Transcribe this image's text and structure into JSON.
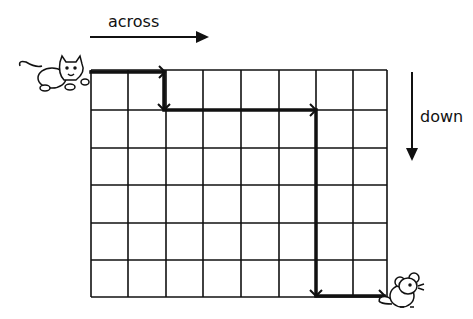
{
  "labels": {
    "across": "across",
    "down": "down"
  },
  "grid": {
    "columns": 8,
    "rows": 6,
    "x_lines": [
      91,
      128,
      166,
      203,
      241,
      279,
      316,
      353,
      387
    ],
    "y_lines": [
      70,
      110,
      148,
      185,
      223,
      260,
      297
    ]
  },
  "path": {
    "description": "Route from cat (top-left) to mouse (bottom-right)",
    "steps": [
      {
        "direction": "across",
        "squares": 2
      },
      {
        "direction": "down",
        "squares": 1
      },
      {
        "direction": "across",
        "squares": 4
      },
      {
        "direction": "down",
        "squares": 5
      },
      {
        "direction": "across",
        "squares": 2
      }
    ]
  },
  "characters": {
    "start": "cat",
    "end": "mouse"
  },
  "colors": {
    "ink": "#111111",
    "background": "#ffffff"
  }
}
